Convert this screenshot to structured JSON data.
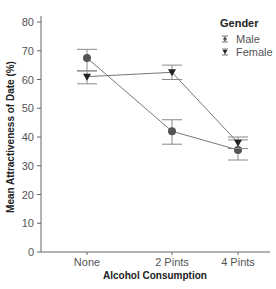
{
  "chart_data": {
    "type": "line",
    "title": "",
    "xlabel": "Alcohol Consumption",
    "ylabel": "Mean Attractiveness of Date (%)",
    "categories": [
      "None",
      "2 Pints",
      "4 Pints"
    ],
    "ylim": [
      0,
      80
    ],
    "yticks": [
      0,
      10,
      20,
      30,
      40,
      50,
      60,
      70,
      80
    ],
    "grid": false,
    "legend_title": "Gender",
    "legend_position": "top-right",
    "series": [
      {
        "name": "Male",
        "marker": "circle",
        "values": [
          67.5,
          42,
          35.5
        ],
        "error_low": [
          63,
          37.5,
          32
        ],
        "error_high": [
          70.5,
          46,
          39
        ]
      },
      {
        "name": "Female",
        "marker": "triangle-down",
        "values": [
          61,
          62.5,
          38
        ],
        "error_low": [
          58.5,
          60,
          36
        ],
        "error_high": [
          63,
          65,
          40
        ]
      }
    ]
  }
}
